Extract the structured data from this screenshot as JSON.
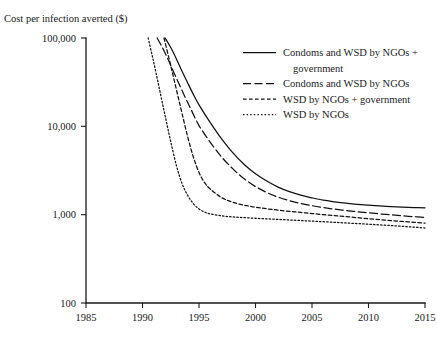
{
  "chart_data": {
    "type": "line",
    "title": "",
    "ylabel": "Cost per infection averted ($)",
    "xlabel": "",
    "yscale": "log",
    "ylim": [
      100,
      100000
    ],
    "xlim": [
      1985,
      2015
    ],
    "grid": false,
    "legend_position": "top-right",
    "ytick_labels": [
      "100,000",
      "10,000",
      "1,000",
      "100"
    ],
    "ytick_values": [
      100000,
      10000,
      1000,
      100
    ],
    "xtick_labels": [
      "1985",
      "1990",
      "1995",
      "2000",
      "2005",
      "2010",
      "2015"
    ],
    "xtick_values": [
      1985,
      1990,
      1995,
      2000,
      2005,
      2010,
      2015
    ],
    "series": [
      {
        "name": "Condoms and WSD by NGOs + government",
        "style": "solid",
        "x": [
          1992.0,
          1992.5,
          1993.0,
          1993.5,
          1994.0,
          1994.5,
          1995.0,
          1996.0,
          1997.0,
          1998.0,
          1999.0,
          2000.0,
          2001.0,
          2002.0,
          2003.0,
          2004.0,
          2005.0,
          2006.0,
          2007.0,
          2008.0,
          2009.0,
          2010.0,
          2011.0,
          2012.0,
          2013.0,
          2014.0,
          2015.0
        ],
        "y": [
          100000,
          78000,
          58000,
          42000,
          31000,
          23000,
          17500,
          11000,
          7200,
          5000,
          3700,
          2900,
          2400,
          2050,
          1820,
          1660,
          1550,
          1460,
          1400,
          1350,
          1310,
          1280,
          1255,
          1235,
          1220,
          1205,
          1195
        ]
      },
      {
        "name": "Condoms and WSD by NGOs",
        "style": "dashed",
        "x": [
          1991.3,
          1991.8,
          1992.3,
          1992.8,
          1993.3,
          1993.8,
          1994.3,
          1995.0,
          1996.0,
          1997.0,
          1998.0,
          1999.0,
          2000.0,
          2001.0,
          2002.0,
          2003.0,
          2004.0,
          2005.0,
          2006.0,
          2007.0,
          2008.0,
          2009.0,
          2010.0,
          2011.0,
          2012.0,
          2013.0,
          2014.0,
          2015.0
        ],
        "y": [
          100000,
          76000,
          56000,
          40000,
          29000,
          21000,
          15500,
          10200,
          6600,
          4500,
          3300,
          2550,
          2080,
          1780,
          1580,
          1440,
          1340,
          1265,
          1205,
          1155,
          1115,
          1080,
          1050,
          1020,
          995,
          970,
          950,
          930
        ]
      },
      {
        "name": "WSD by NGOs + government",
        "style": "dotted-dash",
        "x": [
          1991.9,
          1992.3,
          1992.7,
          1993.1,
          1993.5,
          1994.0,
          1994.5,
          1995.0,
          1995.5,
          1996.0,
          1997.0,
          1998.0,
          1999.0,
          2000.0,
          2001.0,
          2002.0,
          2003.0,
          2004.0,
          2005.0,
          2006.0,
          2007.0,
          2008.0,
          2009.0,
          2010.0,
          2011.0,
          2012.0,
          2013.0,
          2014.0,
          2015.0
        ],
        "y": [
          100000,
          62000,
          38000,
          23000,
          14000,
          7600,
          4500,
          3000,
          2300,
          1950,
          1560,
          1380,
          1280,
          1215,
          1165,
          1125,
          1090,
          1060,
          1030,
          1000,
          975,
          950,
          925,
          900,
          880,
          858,
          838,
          820,
          800
        ]
      },
      {
        "name": "WSD by NGOs",
        "style": "dotted",
        "x": [
          1990.5,
          1990.9,
          1991.3,
          1991.7,
          1992.1,
          1992.5,
          1993.0,
          1993.5,
          1994.0,
          1994.5,
          1995.0,
          1995.5,
          1996.0,
          1997.0,
          1998.0,
          1999.0,
          2000.0,
          2001.0,
          2002.0,
          2003.0,
          2004.0,
          2005.0,
          2006.0,
          2007.0,
          2008.0,
          2009.0,
          2010.0,
          2011.0,
          2012.0,
          2013.0,
          2014.0,
          2015.0
        ],
        "y": [
          100000,
          60000,
          35000,
          20000,
          11500,
          6700,
          3600,
          2250,
          1650,
          1330,
          1160,
          1070,
          1020,
          970,
          942,
          925,
          910,
          897,
          884,
          871,
          858,
          845,
          832,
          819,
          806,
          793,
          780,
          766,
          752,
          737,
          722,
          706
        ]
      }
    ]
  },
  "legend": {
    "entries": [
      {
        "label_line1": "Condoms and WSD by NGOs +",
        "label_line2": "government"
      },
      {
        "label_line1": "Condoms and WSD by NGOs",
        "label_line2": ""
      },
      {
        "label_line1": "WSD by NGOs + government",
        "label_line2": ""
      },
      {
        "label_line1": "WSD by NGOs",
        "label_line2": ""
      }
    ]
  }
}
